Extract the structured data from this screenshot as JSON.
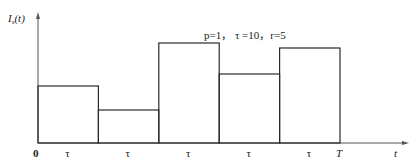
{
  "chart_data": {
    "type": "bar",
    "style": "step",
    "title": "",
    "annotation": "p=1，  τ =10，r=5",
    "ylabel": "I_s(t)",
    "ylabel_main": "I",
    "ylabel_sub": "s",
    "ylabel_arg": "(t)",
    "xlabel": "t",
    "origin_label": "0",
    "end_label": "T",
    "categories": [
      "τ",
      "τ",
      "τ",
      "τ",
      "τ"
    ],
    "values": [
      57,
      33,
      100,
      69,
      95
    ],
    "value_units": "relative height (unlabeled axis, tallest = 100)",
    "ylim": [
      0,
      120
    ],
    "grid": false,
    "legend": "none"
  },
  "colors": {
    "line": "#2a2a2a",
    "axis": "#555555",
    "text": "#1a1a1a"
  }
}
